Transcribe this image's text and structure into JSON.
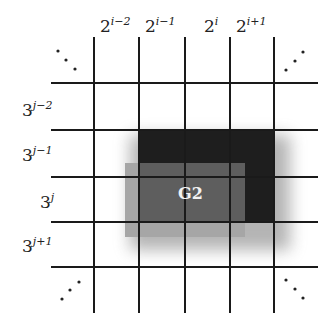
{
  "diagram": {
    "title": "",
    "column_labels": [
      {
        "base": "2",
        "exp": "i−2",
        "x": 100
      },
      {
        "base": "2",
        "exp": "i−1",
        "x": 145
      },
      {
        "base": "2",
        "exp": "i",
        "x": 204
      },
      {
        "base": "2",
        "exp": "i+1",
        "x": 236
      }
    ],
    "row_labels": [
      {
        "base": "3",
        "exp": "j−2",
        "y": 100,
        "x": 22
      },
      {
        "base": "3",
        "exp": "j−1",
        "y": 145,
        "x": 22
      },
      {
        "base": "3",
        "exp": "j",
        "y": 192,
        "x": 40
      },
      {
        "base": "3",
        "exp": "j+1",
        "y": 236,
        "x": 22
      }
    ],
    "region_label": "G2",
    "ellipsis_glyph": "⋱",
    "grid": {
      "vertical_x": [
        94,
        139,
        185,
        230,
        274
      ],
      "vertical_y_range": [
        37,
        313
      ],
      "horizontal_y": [
        83,
        130,
        177,
        222,
        267
      ],
      "horizontal_x_range": [
        51,
        318
      ],
      "line_color": "#1a1a1a"
    },
    "regions": [
      {
        "name": "light-region",
        "x": 125,
        "y": 163,
        "w": 120,
        "h": 74,
        "color": "#a6a6a6"
      },
      {
        "name": "dark-region",
        "x": 139,
        "y": 130,
        "w": 136,
        "h": 92,
        "color": "#1e1e1e"
      },
      {
        "name": "g2-region",
        "x": 139,
        "y": 163,
        "w": 106,
        "h": 59,
        "color": "#5e5e5e"
      }
    ]
  }
}
